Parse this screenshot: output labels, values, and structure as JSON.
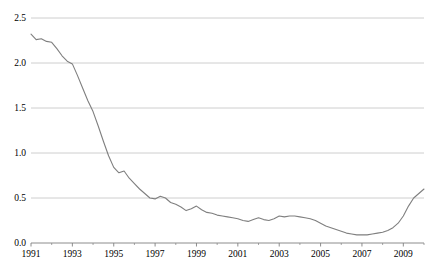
{
  "chart_data": {
    "type": "line",
    "title": "",
    "subtitle": "",
    "xlabel": "",
    "ylabel": "",
    "xlim": [
      1991.0,
      2010.0
    ],
    "ylim": [
      0.0,
      2.5
    ],
    "grid": true,
    "grid_axis": "y",
    "legend": "none",
    "yticks": [
      0.0,
      0.5,
      1.0,
      1.5,
      2.0,
      2.5
    ],
    "ytick_labels": [
      "0.0",
      "0.5",
      "1.0",
      "1.5",
      "2.0",
      "2.5"
    ],
    "xticks": [
      1991,
      1993,
      1995,
      1997,
      1999,
      2001,
      2003,
      2005,
      2007,
      2009
    ],
    "xtick_labels": [
      "1991",
      "1993",
      "1995",
      "1997",
      "1999",
      "2001",
      "2003",
      "2005",
      "2007",
      "2009"
    ],
    "xminor_ticks": [
      1992,
      1994,
      1996,
      1998,
      2000,
      2002,
      2004,
      2006,
      2008,
      2010
    ],
    "series": [
      {
        "name": "series-1",
        "color": "#7f7f7f",
        "line_width": 1.1,
        "x": [
          1991.0,
          1991.25,
          1991.5,
          1991.75,
          1992.0,
          1992.25,
          1992.5,
          1992.75,
          1993.0,
          1993.25,
          1993.5,
          1993.75,
          1994.0,
          1994.25,
          1994.5,
          1994.75,
          1995.0,
          1995.25,
          1995.5,
          1995.75,
          1996.0,
          1996.25,
          1996.5,
          1996.75,
          1997.0,
          1997.25,
          1997.5,
          1997.75,
          1998.0,
          1998.25,
          1998.5,
          1998.75,
          1999.0,
          1999.25,
          1999.5,
          1999.75,
          2000.0,
          2000.25,
          2000.5,
          2000.75,
          2001.0,
          2001.25,
          2001.5,
          2001.75,
          2002.0,
          2002.25,
          2002.5,
          2002.75,
          2003.0,
          2003.25,
          2003.5,
          2003.75,
          2004.0,
          2004.25,
          2004.5,
          2004.75,
          2005.0,
          2005.25,
          2005.5,
          2005.75,
          2006.0,
          2006.25,
          2006.5,
          2006.75,
          2007.0,
          2007.25,
          2007.5,
          2007.75,
          2008.0,
          2008.25,
          2008.5,
          2008.75,
          2009.0,
          2009.25,
          2009.5,
          2009.75,
          2010.0
        ],
        "y": [
          2.32,
          2.26,
          2.27,
          2.24,
          2.23,
          2.16,
          2.08,
          2.02,
          1.99,
          1.86,
          1.72,
          1.58,
          1.46,
          1.3,
          1.13,
          0.97,
          0.84,
          0.78,
          0.8,
          0.72,
          0.66,
          0.6,
          0.55,
          0.5,
          0.49,
          0.52,
          0.5,
          0.45,
          0.43,
          0.4,
          0.36,
          0.38,
          0.41,
          0.37,
          0.34,
          0.33,
          0.31,
          0.3,
          0.29,
          0.28,
          0.27,
          0.25,
          0.24,
          0.26,
          0.28,
          0.26,
          0.25,
          0.27,
          0.3,
          0.29,
          0.3,
          0.3,
          0.29,
          0.28,
          0.27,
          0.25,
          0.22,
          0.19,
          0.17,
          0.15,
          0.13,
          0.11,
          0.1,
          0.09,
          0.09,
          0.09,
          0.1,
          0.11,
          0.12,
          0.14,
          0.17,
          0.22,
          0.3,
          0.41,
          0.5,
          0.55,
          0.6
        ]
      }
    ]
  },
  "axes": {
    "axis_color": "#808080",
    "grid_color": "#c8c8c8",
    "tick_color": "#808080",
    "label_color": "#000000"
  }
}
